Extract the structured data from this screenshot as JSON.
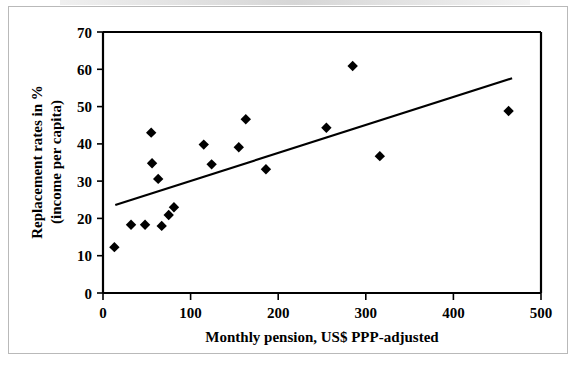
{
  "figure": {
    "background_color": "#ffffff",
    "frame_color": "#b9b9b9",
    "marker_color": "#000000",
    "axis_color": "#000000",
    "trendline_color": "#000000"
  },
  "chart_data": {
    "type": "scatter",
    "title": "",
    "xlabel": "Monthly pension, US$ PPP-adjusted",
    "ylabel_line1": "Replacement rates in %",
    "ylabel_line2": "(income per capita)",
    "xlim": [
      0,
      500
    ],
    "ylim": [
      0,
      70
    ],
    "xticks": [
      0,
      100,
      200,
      300,
      400,
      500
    ],
    "xtick_labels": [
      "0",
      "100",
      "200",
      "300",
      "400",
      "500"
    ],
    "yticks": [
      0,
      10,
      20,
      30,
      40,
      50,
      60,
      70
    ],
    "ytick_labels": [
      "0",
      "10",
      "20",
      "30",
      "40",
      "50",
      "60",
      "70"
    ],
    "grid": false,
    "legend": null,
    "marker": "diamond",
    "points": [
      {
        "x": 13,
        "y": 12.3
      },
      {
        "x": 32,
        "y": 18.3
      },
      {
        "x": 48,
        "y": 18.3
      },
      {
        "x": 55,
        "y": 43.0
      },
      {
        "x": 56,
        "y": 34.8
      },
      {
        "x": 63,
        "y": 30.6
      },
      {
        "x": 67,
        "y": 18.0
      },
      {
        "x": 75,
        "y": 20.9
      },
      {
        "x": 81,
        "y": 23.0
      },
      {
        "x": 115,
        "y": 39.8
      },
      {
        "x": 124,
        "y": 34.5
      },
      {
        "x": 155,
        "y": 39.1
      },
      {
        "x": 163,
        "y": 46.6
      },
      {
        "x": 186,
        "y": 33.2
      },
      {
        "x": 255,
        "y": 44.3
      },
      {
        "x": 285,
        "y": 60.9
      },
      {
        "x": 316,
        "y": 36.7
      },
      {
        "x": 463,
        "y": 48.8
      }
    ],
    "trendline": {
      "type": "linear",
      "x_start": 14,
      "y_start": 23.6,
      "x_end": 467,
      "y_end": 57.6
    }
  }
}
